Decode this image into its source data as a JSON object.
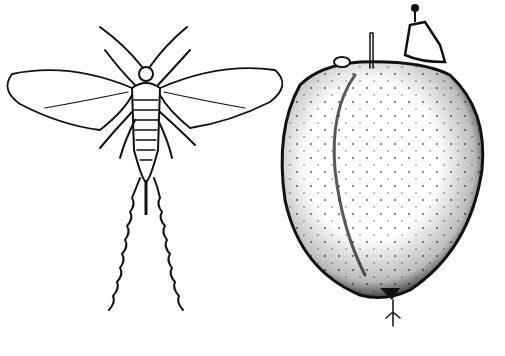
{
  "figure": {
    "colors": {
      "ink": "#111111",
      "background": "#ffffff"
    },
    "panels": [
      {
        "subject": "winged-insect"
      },
      {
        "subject": "stippled-gall"
      }
    ]
  }
}
